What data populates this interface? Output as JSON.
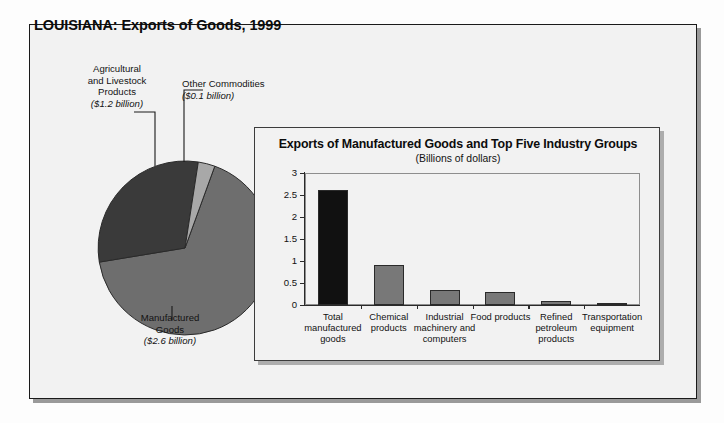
{
  "page": {
    "title": "LOUISIANA: Exports of Goods, 1999"
  },
  "pie": {
    "labels": {
      "agricultural": {
        "name": "Agricultural\nand Livestock\nProducts",
        "line1": "Agricultural",
        "line2": "and Livestock",
        "line3": "Products",
        "amount": "($1.2 billion)"
      },
      "other": {
        "line1": "Other Commodities",
        "amount": "($0.1 billion)"
      },
      "manufactured": {
        "line1": "Manufactured",
        "line2": "Goods",
        "amount": "($2.6 billion)"
      }
    }
  },
  "chart_data": {
    "type": "pie",
    "title": "LOUISIANA: Exports of Goods, 1999",
    "unit": "Billions of dollars",
    "categories": [
      "Manufactured Goods",
      "Agricultural and Livestock Products",
      "Other Commodities"
    ],
    "values": [
      2.6,
      1.2,
      0.1
    ],
    "labels": [
      "($2.6 billion)",
      "($1.2 billion)",
      "($0.1 billion)"
    ],
    "colors": [
      "#6e6e6e",
      "#3a3a3a",
      "#a8a8a8"
    ],
    "legend": "none"
  },
  "callout": {
    "title": "Exports of Manufactured Goods and Top Five Industry Groups",
    "subtitle": "(Billions of dollars)",
    "chart_data": {
      "type": "bar",
      "title": "Exports of Manufactured Goods and Top Five Industry Groups",
      "subtitle": "(Billions of dollars)",
      "xlabel": "",
      "ylabel": "",
      "ylim": [
        0,
        3
      ],
      "yticks": [
        "0",
        "0.5",
        "1",
        "1.5",
        "2",
        "2.5",
        "3"
      ],
      "ytick_values": [
        0,
        0.5,
        1,
        1.5,
        2,
        2.5,
        3
      ],
      "grid": false,
      "legend": "none",
      "categories": [
        "Total manufactured goods",
        "Chemical products",
        "Industrial machinery and computers",
        "Food products",
        "Refined petroleum products",
        "Transportation equipment"
      ],
      "category_lines": [
        [
          "Total",
          "manufactured",
          "goods"
        ],
        [
          "Chemical",
          "products"
        ],
        [
          "Industrial",
          "machinery and",
          "computers"
        ],
        [
          "Food products"
        ],
        [
          "Refined",
          "petroleum",
          "products"
        ],
        [
          "Transportation",
          "equipment"
        ]
      ],
      "values": [
        2.62,
        0.92,
        0.35,
        0.3,
        0.09,
        0.05
      ],
      "colors": [
        "#111111",
        "#787878",
        "#787878",
        "#787878",
        "#787878",
        "#787878"
      ]
    }
  }
}
